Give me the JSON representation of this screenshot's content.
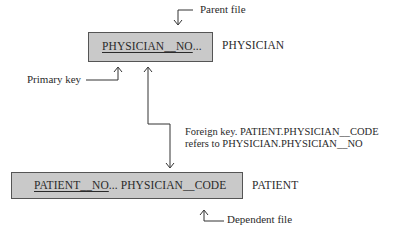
{
  "diagram": {
    "parent": {
      "table_name": "PHYSICIAN",
      "primary_key_field": "PHYSICIAN__NO",
      "ellipsis": "...",
      "role_label": "Parent file"
    },
    "child": {
      "table_name": "PATIENT",
      "primary_key_field": "PATIENT__NO",
      "ellipsis": "...",
      "foreign_key_field": "PHYSICIAN__CODE",
      "role_label": "Dependent file"
    },
    "annotations": {
      "primary_key": "Primary key",
      "foreign_key_line1": "Foreign key. PATIENT.PHYSICIAN__CODE",
      "foreign_key_line2": "refers to PHYSICIAN.PHYSICIAN__NO"
    },
    "colors": {
      "box_fill": "#c9c9c9",
      "box_border": "#555555",
      "line": "#333333"
    }
  }
}
